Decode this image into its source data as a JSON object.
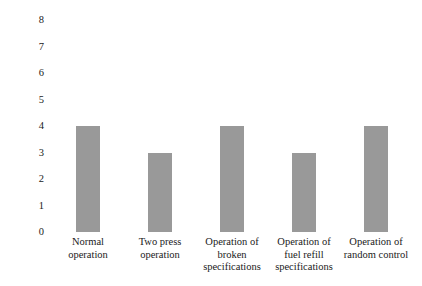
{
  "chart_data": {
    "type": "bar",
    "title": "",
    "subtitle": "",
    "xlabel": "",
    "ylabel": "Number of positive answers",
    "categories": [
      "Normal operation",
      "Two press operation",
      "Operation of broken specifications",
      "Operation of fuel refill specifications",
      "Operation of random control"
    ],
    "category_lines": [
      [
        "Normal",
        "operation"
      ],
      [
        "Two press",
        "operation"
      ],
      [
        "Operation of",
        "broken",
        "specifications"
      ],
      [
        "Operation of",
        "fuel refill",
        "specifications"
      ],
      [
        "Operation of",
        "random control"
      ]
    ],
    "values": [
      4,
      3,
      4,
      3,
      4
    ],
    "ylim": [
      0,
      8
    ],
    "yticks": [
      8,
      7,
      6,
      5,
      4,
      3,
      2,
      1,
      0
    ],
    "ytick_labels": [
      "8",
      "7",
      "6",
      "5",
      "4",
      "3",
      "2",
      "1",
      "0"
    ],
    "grid": false,
    "axis_lines": false,
    "tick_marks": false,
    "legend": false,
    "legend_position": "none",
    "bar_color": "#999999",
    "background_color": "#ffffff",
    "text_color": "#1a1a1a"
  }
}
